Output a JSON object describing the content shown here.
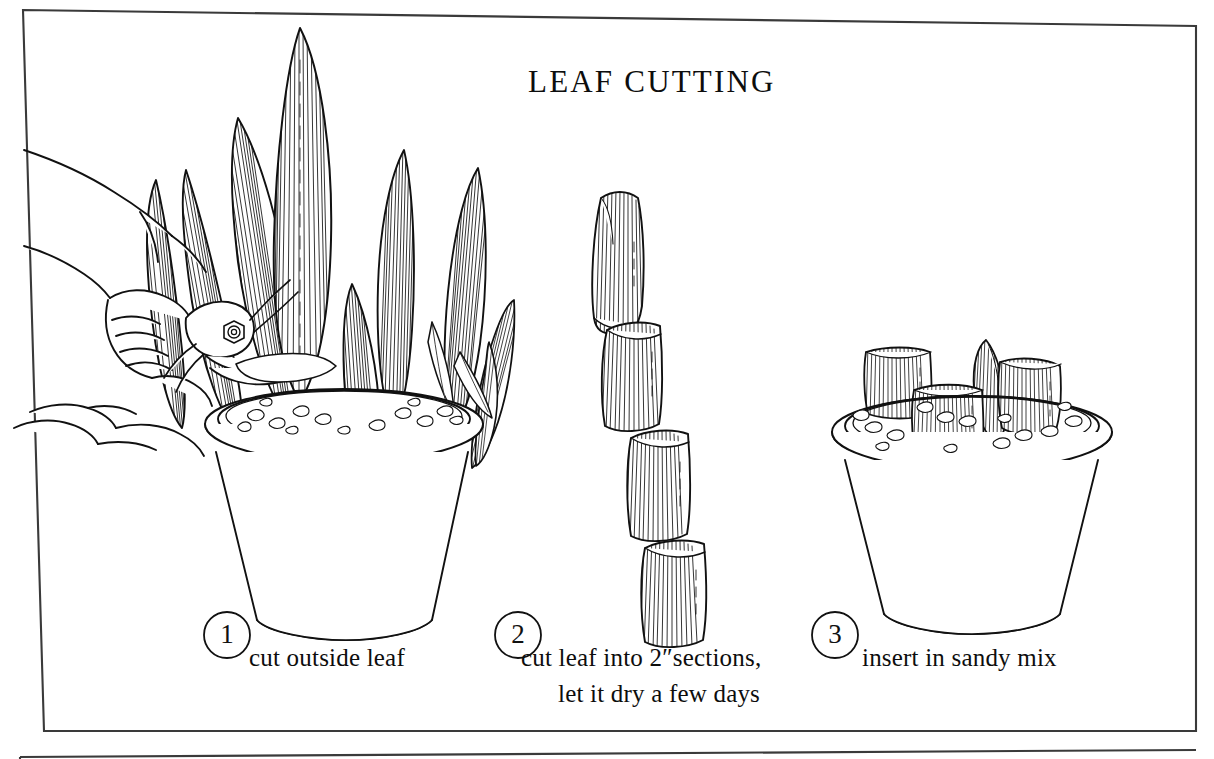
{
  "page": {
    "background_color": "#ffffff",
    "ink_color": "#111111",
    "title": "LEAF  CUTTING",
    "illustration_type": "pen-and-ink line drawing"
  },
  "frame": {
    "outer_border_color": "#3a3a3a",
    "has_lower_partial_frame": true
  },
  "steps": [
    {
      "number": "1",
      "caption_lines": [
        "cut outside leaf"
      ],
      "scene": "hand holding pruning shears cutting an outside leaf of a potted sansevieria"
    },
    {
      "number": "2",
      "caption_lines": [
        "cut leaf into 2″sections,",
        "let it dry a few days"
      ],
      "scene": "one leaf divided into four stacked striated sections"
    },
    {
      "number": "3",
      "caption_lines": [
        "insert in sandy mix"
      ],
      "scene": "four leaf sections inserted upright into a pot of sandy gravel mix"
    }
  ]
}
